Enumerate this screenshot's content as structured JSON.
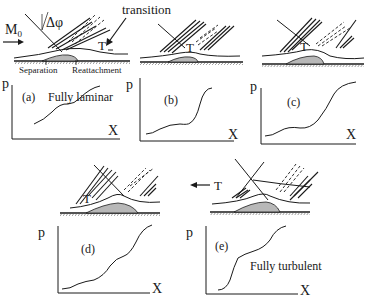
{
  "figure": {
    "labels": {
      "mach": "M",
      "mach_sub": "0",
      "delta_phi": "Δφ",
      "transition": "transition",
      "separation": "Separation",
      "reattachment": "Reattachment",
      "transition_marker": "T"
    },
    "panels": [
      {
        "id": "a",
        "tag": "(a)",
        "caption": "Fully laminar",
        "y_axis": "p",
        "x_axis": "X"
      },
      {
        "id": "b",
        "tag": "(b)",
        "caption": "",
        "y_axis": "p",
        "x_axis": "X"
      },
      {
        "id": "c",
        "tag": "(c)",
        "caption": "",
        "y_axis": "p",
        "x_axis": "X"
      },
      {
        "id": "d",
        "tag": "(d)",
        "caption": "",
        "y_axis": "p",
        "x_axis": "X"
      },
      {
        "id": "e",
        "tag": "(e)",
        "caption": "Fully turbulent",
        "y_axis": "p",
        "x_axis": "X"
      }
    ],
    "colors": {
      "ink": "#1a1a1a",
      "bubble_fill": "#b8b8b8",
      "background": "#ffffff"
    }
  }
}
